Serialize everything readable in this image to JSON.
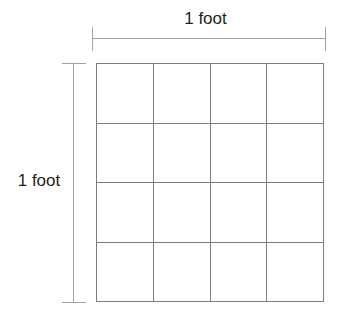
{
  "figure": {
    "name": "one-square-foot-grid-diagram",
    "background_color": "#ffffff",
    "grid_line_color": "#7d7d7d",
    "dimension_line_color": "#a3a3a3",
    "text_color": "#231f20"
  },
  "labels": {
    "top": "1 foot",
    "left": "1 foot"
  },
  "grid": {
    "columns": 4,
    "rows": 4,
    "total_cells": 16,
    "cells": [
      {
        "row": 1,
        "col": 1,
        "label": ""
      },
      {
        "row": 1,
        "col": 2,
        "label": ""
      },
      {
        "row": 1,
        "col": 3,
        "label": ""
      },
      {
        "row": 1,
        "col": 4,
        "label": ""
      },
      {
        "row": 2,
        "col": 1,
        "label": ""
      },
      {
        "row": 2,
        "col": 2,
        "label": ""
      },
      {
        "row": 2,
        "col": 3,
        "label": ""
      },
      {
        "row": 2,
        "col": 4,
        "label": ""
      },
      {
        "row": 3,
        "col": 1,
        "label": ""
      },
      {
        "row": 3,
        "col": 2,
        "label": ""
      },
      {
        "row": 3,
        "col": 3,
        "label": ""
      },
      {
        "row": 3,
        "col": 4,
        "label": ""
      },
      {
        "row": 4,
        "col": 1,
        "label": ""
      },
      {
        "row": 4,
        "col": 2,
        "label": ""
      },
      {
        "row": 4,
        "col": 3,
        "label": ""
      },
      {
        "row": 4,
        "col": 4,
        "label": ""
      }
    ]
  },
  "dimensions": {
    "top": {
      "icon": "dimension-line-horizontal",
      "value": "1 foot"
    },
    "left": {
      "icon": "dimension-line-vertical",
      "value": "1 foot"
    }
  }
}
